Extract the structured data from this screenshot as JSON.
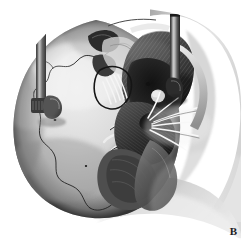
{
  "figure": {
    "panel_label": "B",
    "modality": "grayscale anatomical line-and-wash illustration",
    "background_color": "#ffffff",
    "width": 247,
    "height": 249
  },
  "palette": {
    "background": "#ffffff",
    "bone_highlight": "#f2f2f2",
    "bone_light": "#dcdcdc",
    "bone_mid": "#b4b4b4",
    "bone_shadow": "#8a8a8a",
    "bone_deep_shadow": "#5a5a5a",
    "muscle_dark": "#3c3c3c",
    "muscle_mid": "#6a6a6a",
    "cavity_black": "#141414",
    "instrument_dark": "#2a2a2a",
    "instrument_mid": "#5e5e5e",
    "instrument_highlight": "#9a9a9a",
    "suture_line": "#262626",
    "nerve_white": "#f7f7f7",
    "label_color": "#1d1d1d"
  },
  "structures": [
    {
      "id": "cranial-vault",
      "label": "Cranial vault (parietal / temporal squama)",
      "tone": "bone_light"
    },
    {
      "id": "squamosal-suture",
      "label": "Squamosal suture",
      "tone": "suture_line"
    },
    {
      "id": "parietomastoid-suture",
      "label": "Parietomastoid suture",
      "tone": "suture_line"
    },
    {
      "id": "temporalis-muscle",
      "label": "Temporalis muscle with fiber striations",
      "tone": "muscle_dark"
    },
    {
      "id": "zygomatic-arch",
      "label": "Zygomatic arch",
      "tone": "bone_mid"
    },
    {
      "id": "mandibular-ramus",
      "label": "Mandibular ramus / condyle",
      "tone": "bone_mid"
    },
    {
      "id": "external-acoustic-meatus",
      "label": "External acoustic meatus (dark cavity)",
      "tone": "cavity_black"
    },
    {
      "id": "mastoid-process",
      "label": "Mastoid process",
      "tone": "bone_shadow"
    },
    {
      "id": "nerve-fascicles-superior",
      "label": "Nerve fascicles, superior group",
      "tone": "nerve_white"
    },
    {
      "id": "nerve-fascicles-radiating",
      "label": "Radiating nerve branches",
      "tone": "nerve_white"
    },
    {
      "id": "vessel-loop",
      "label": "Vascular loop",
      "tone": "bone_highlight"
    },
    {
      "id": "emissary-foramen",
      "label": "Emissary foramen",
      "tone": "cavity_black"
    }
  ],
  "instruments": [
    {
      "id": "retractor-left",
      "label": "Self-retaining retractor blade, posterior",
      "orientation": "vertical",
      "shaft_top_y": 32,
      "shaft_bottom_y": 108,
      "shaft_x": 41
    },
    {
      "id": "retractor-right",
      "label": "Self-retaining retractor blade, anterior",
      "orientation": "vertical",
      "shaft_top_y": 14,
      "shaft_bottom_y": 84,
      "shaft_x": 175
    }
  ]
}
